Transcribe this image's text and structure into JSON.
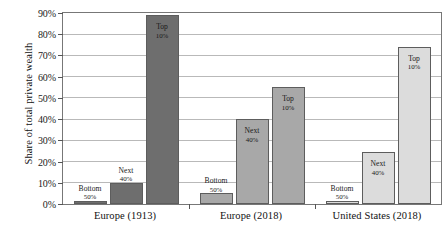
{
  "chart_data": {
    "type": "bar",
    "title": "",
    "subtitle": "",
    "xlabel": "",
    "ylabel": "Share of total private wealth",
    "ylim": [
      0,
      90
    ],
    "ytick_values": [
      0,
      10,
      20,
      30,
      40,
      50,
      60,
      70,
      80,
      90
    ],
    "ytick_labels": [
      "0%",
      "10%",
      "20%",
      "30%",
      "40%",
      "50%",
      "60%",
      "70%",
      "80%",
      "90%"
    ],
    "grid": "horizontal",
    "legend": "none",
    "grouped": true,
    "categories": [
      "Europe (1913)",
      "Europe (2018)",
      "United States (2018)"
    ],
    "series": [
      {
        "name": "Bottom 50%",
        "label_line1": "Bottom",
        "label_line2": "50%",
        "values": [
          1.5,
          5.0,
          1.5
        ]
      },
      {
        "name": "Next 40%",
        "label_line1": "Next",
        "label_line2": "40%",
        "values": [
          10.0,
          40.0,
          24.5
        ]
      },
      {
        "name": "Top 10%",
        "label_line1": "Top",
        "label_line2": "10%",
        "values": [
          89.0,
          55.0,
          74.0
        ]
      }
    ],
    "group_colors": [
      "#6e6e6e",
      "#a8a8a8",
      "#dcdcdc"
    ],
    "bar_edge_color": "#5d5d5d",
    "gridline_color": "#b9b9b9",
    "axis_color": "#777777",
    "text_color": "#1a1a1a",
    "background_color": "#ffffff"
  }
}
